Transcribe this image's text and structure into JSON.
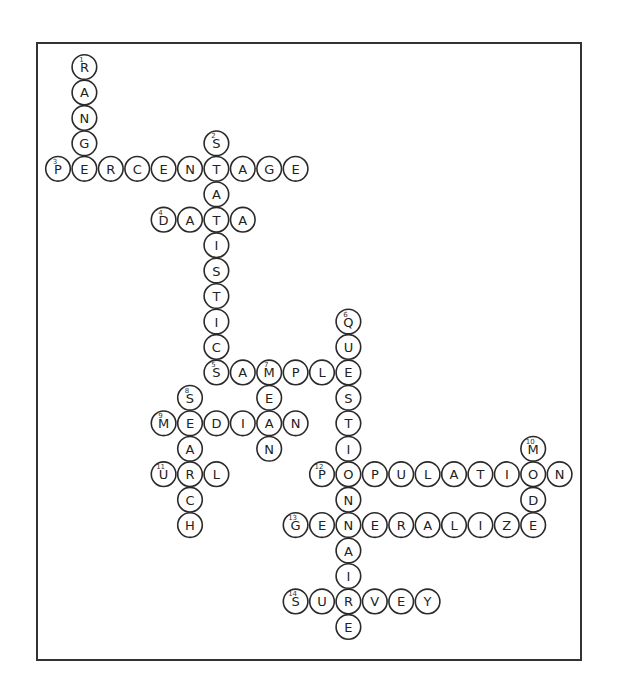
{
  "puzzle": {
    "type": "crossword-solution",
    "layout": {
      "origin_x": 58,
      "origin_y": 67,
      "col_step": 26.4,
      "row_step": 25.45,
      "radius": 12.3
    },
    "words": [
      {
        "number": 1,
        "answer": "RANGE",
        "direction": "down",
        "row": 0,
        "col": 1
      },
      {
        "number": 2,
        "answer": "STATISTICS",
        "direction": "down",
        "row": 3,
        "col": 6
      },
      {
        "number": 3,
        "answer": "PERCENTAGE",
        "direction": "across",
        "row": 4,
        "col": 0
      },
      {
        "number": 4,
        "answer": "DATA",
        "direction": "across",
        "row": 6,
        "col": 4
      },
      {
        "number": 5,
        "answer": "SAMPLE",
        "direction": "across",
        "row": 12,
        "col": 6
      },
      {
        "number": 6,
        "answer": "QUESTIONNAIRE",
        "direction": "down",
        "row": 10,
        "col": 11
      },
      {
        "number": 7,
        "answer": "MEAN",
        "direction": "down",
        "row": 12,
        "col": 8
      },
      {
        "number": 8,
        "answer": "SEARCH",
        "direction": "down",
        "row": 13,
        "col": 5
      },
      {
        "number": 9,
        "answer": "MEDIAN",
        "direction": "across",
        "row": 14,
        "col": 4
      },
      {
        "number": 10,
        "answer": "MODE",
        "direction": "down",
        "row": 15,
        "col": 18
      },
      {
        "number": 11,
        "answer": "URL",
        "direction": "across",
        "row": 16,
        "col": 4
      },
      {
        "number": 12,
        "answer": "POPULATION",
        "direction": "across",
        "row": 16,
        "col": 10
      },
      {
        "number": 13,
        "answer": "GENERALIZE",
        "direction": "across",
        "row": 18,
        "col": 9
      },
      {
        "number": 14,
        "answer": "SURVEY",
        "direction": "across",
        "row": 21,
        "col": 9
      }
    ]
  }
}
